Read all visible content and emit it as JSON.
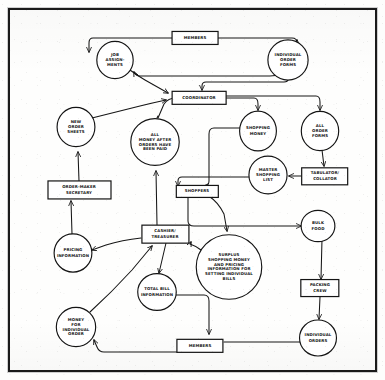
{
  "diagram": {
    "type": "hand-drawn flowchart",
    "style": {
      "stroke_color": "#141414",
      "fill_color": "#ffffff",
      "page_color": "#fefefd",
      "frame_color": "#1a1a1a"
    },
    "nodes": [
      {
        "id": "members_top",
        "label": "MEMBERS",
        "shape": "rect",
        "cx": 195,
        "cy": 38,
        "w": 46,
        "h": 13
      },
      {
        "id": "job_assign",
        "label": "JOB|ASSIGN-|MENTS",
        "shape": "circle",
        "cx": 115,
        "cy": 60,
        "r": 19
      },
      {
        "id": "indiv_forms",
        "label": "INDIVIDUAL|ORDER|FORMS",
        "shape": "circle",
        "cx": 288,
        "cy": 60,
        "r": 20
      },
      {
        "id": "coordinator",
        "label": "COORDINATOR",
        "shape": "rect",
        "cx": 199,
        "cy": 98,
        "w": 54,
        "h": 13
      },
      {
        "id": "new_order",
        "label": "NEW|ORDER|SHEETS",
        "shape": "circle",
        "cx": 76,
        "cy": 127,
        "r": 19
      },
      {
        "id": "all_money",
        "label": "ALL|MONEY AFTER|ORDERS HAVE|BEEN PAID",
        "shape": "circle",
        "cx": 155,
        "cy": 142,
        "r": 24
      },
      {
        "id": "shopping_money",
        "label": "SHOPPING|MONEY",
        "shape": "circle",
        "cx": 258,
        "cy": 131,
        "r": 19
      },
      {
        "id": "all_forms",
        "label": "ALL|ORDER|FORMS",
        "shape": "circle",
        "cx": 320,
        "cy": 131,
        "r": 19
      },
      {
        "id": "master_list",
        "label": "MASTER|SHOPPING|LIST",
        "shape": "circle",
        "cx": 268,
        "cy": 175,
        "r": 19
      },
      {
        "id": "tabulator",
        "label": "TABULATOR/|COLLATOR",
        "shape": "rect",
        "cx": 325,
        "cy": 176,
        "w": 46,
        "h": 17
      },
      {
        "id": "order_maker",
        "label": "ORDER-MAKER|SECRETARY",
        "shape": "rect",
        "cx": 79,
        "cy": 190,
        "w": 63,
        "h": 18
      },
      {
        "id": "shoppers",
        "label": "SHOPPERS",
        "shape": "rect",
        "cx": 197,
        "cy": 191,
        "w": 42,
        "h": 12
      },
      {
        "id": "bulk_food",
        "label": "BULK|FOOD",
        "shape": "circle",
        "cx": 318,
        "cy": 226,
        "r": 16
      },
      {
        "id": "cashier",
        "label": "CASHIER/|TREASURER",
        "shape": "rect",
        "cx": 165,
        "cy": 234,
        "w": 47,
        "h": 18
      },
      {
        "id": "pricing_info",
        "label": "PRICING|INFORMATION",
        "shape": "circle",
        "cx": 73,
        "cy": 253,
        "r": 19
      },
      {
        "id": "surplus",
        "label": "SURPLUS|SHOPPING MONEY|AND PRICING|INFORMATION FOR|SETTING INDIVIDUAL|BILLS",
        "shape": "circle",
        "cx": 229,
        "cy": 267,
        "r": 32
      },
      {
        "id": "packing_crew",
        "label": "PACKING|CREW",
        "shape": "rect",
        "cx": 320,
        "cy": 288,
        "w": 38,
        "h": 17
      },
      {
        "id": "total_bill",
        "label": "TOTAL BILL|INFORMATION",
        "shape": "circle",
        "cx": 157,
        "cy": 292,
        "r": 19
      },
      {
        "id": "money_indiv",
        "label": "MONEY|FOR|INDIVIDUAL|ORDER",
        "shape": "circle",
        "cx": 76,
        "cy": 327,
        "r": 20
      },
      {
        "id": "indiv_orders",
        "label": "INDIVIDUAL|ORDERS",
        "shape": "circle",
        "cx": 318,
        "cy": 338,
        "r": 18
      },
      {
        "id": "members_bot",
        "label": "MEMBERS",
        "shape": "rect",
        "cx": 200,
        "cy": 346,
        "w": 46,
        "h": 13
      }
    ],
    "edges": [
      {
        "from": "members_top",
        "to": "job_assign"
      },
      {
        "from": "members_top",
        "to": "indiv_forms"
      },
      {
        "from": "indiv_forms",
        "to": "job_assign"
      },
      {
        "from": "indiv_forms",
        "to": "coordinator"
      },
      {
        "from": "coordinator",
        "to": "all_money"
      },
      {
        "from": "coordinator",
        "to": "shopping_money"
      },
      {
        "from": "coordinator",
        "to": "all_forms"
      },
      {
        "from": "new_order",
        "to": "coordinator"
      },
      {
        "from": "order_maker",
        "to": "new_order"
      },
      {
        "from": "pricing_info",
        "to": "order_maker"
      },
      {
        "from": "all_forms",
        "to": "tabulator"
      },
      {
        "from": "tabulator",
        "to": "master_list"
      },
      {
        "from": "master_list",
        "to": "shoppers"
      },
      {
        "from": "shopping_money",
        "to": "shoppers"
      },
      {
        "from": "shoppers",
        "to": "surplus"
      },
      {
        "from": "shoppers",
        "to": "bulk_food"
      },
      {
        "from": "surplus",
        "to": "cashier"
      },
      {
        "from": "cashier",
        "to": "pricing_info"
      },
      {
        "from": "cashier",
        "to": "all_money"
      },
      {
        "from": "cashier",
        "to": "total_bill"
      },
      {
        "from": "bulk_food",
        "to": "packing_crew"
      },
      {
        "from": "packing_crew",
        "to": "indiv_orders"
      },
      {
        "from": "indiv_orders",
        "to": "members_bot"
      },
      {
        "from": "total_bill",
        "to": "members_bot"
      },
      {
        "from": "members_bot",
        "to": "money_indiv"
      },
      {
        "from": "money_indiv",
        "to": "cashier"
      },
      {
        "from": "all_money",
        "to": "coordinator"
      }
    ]
  }
}
